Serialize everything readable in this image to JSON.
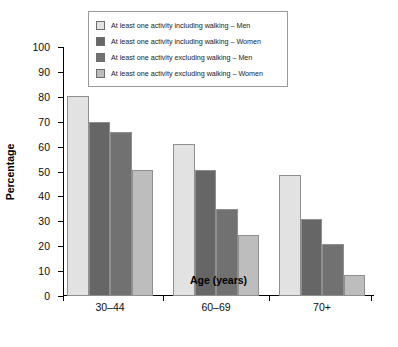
{
  "chart_data": {
    "type": "bar",
    "title": "",
    "subtitle": "",
    "xlabel": "Age (years)",
    "ylabel": "Percentage",
    "categories": [
      "30–44",
      "60–69",
      "70+"
    ],
    "ylim": [
      0,
      100
    ],
    "yticks": [
      0,
      10,
      20,
      30,
      40,
      50,
      60,
      70,
      80,
      90,
      100
    ],
    "grid": false,
    "legend_position": "top-center",
    "series": [
      {
        "name": "At least one activity including walking – Men",
        "color": "#e2e2e2",
        "values": [
          80.5,
          61,
          48.5
        ]
      },
      {
        "name": "At least one activity including walking – Women",
        "color": "#666666",
        "values": [
          70,
          50.5,
          31
        ]
      },
      {
        "name": "At least one activity excluding walking – Men",
        "color": "#717171",
        "values": [
          66,
          35,
          21
        ]
      },
      {
        "name": "At least one activity excluding walking – Women",
        "color": "#bdbdbd",
        "values": [
          50.5,
          24.5,
          8.5
        ]
      }
    ]
  },
  "colors": {
    "axis": "#000000",
    "bar_border": "#8f8f8f",
    "legend_border": "#9a9a9a",
    "text": "#0d0d0d"
  }
}
